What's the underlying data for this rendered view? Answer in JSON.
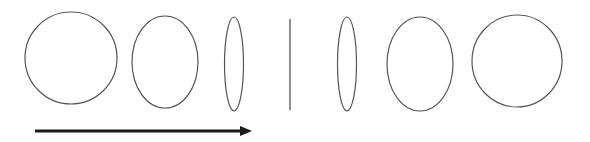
{
  "diagram": {
    "colors": {
      "background": "#ffffff",
      "outline": "#555555",
      "arrow": "#1a1a1a"
    },
    "shapes": [
      {
        "name": "circle-left",
        "type": "ellipse",
        "cx": 71,
        "cy": 58,
        "rx": 46,
        "ry": 46
      },
      {
        "name": "ellipse-wide-left",
        "type": "ellipse",
        "cx": 165,
        "cy": 62,
        "rx": 33,
        "ry": 46
      },
      {
        "name": "ellipse-thin-left",
        "type": "ellipse",
        "cx": 234,
        "cy": 64,
        "rx": 9.5,
        "ry": 47
      },
      {
        "name": "edge-on-line",
        "type": "line",
        "x1": 290,
        "y1": 19,
        "x2": 290,
        "y2": 110
      },
      {
        "name": "ellipse-thin-right",
        "type": "ellipse",
        "cx": 347,
        "cy": 64,
        "rx": 9.5,
        "ry": 47
      },
      {
        "name": "ellipse-wide-right",
        "type": "ellipse",
        "cx": 420,
        "cy": 64,
        "rx": 33,
        "ry": 47
      },
      {
        "name": "circle-right",
        "type": "ellipse",
        "cx": 517,
        "cy": 61,
        "rx": 45,
        "ry": 46
      }
    ],
    "arrow": {
      "x1": 35,
      "y1": 131,
      "x2": 240,
      "y2": 131,
      "head_tip_x": 252,
      "head_half_height": 5,
      "direction": "right"
    }
  }
}
